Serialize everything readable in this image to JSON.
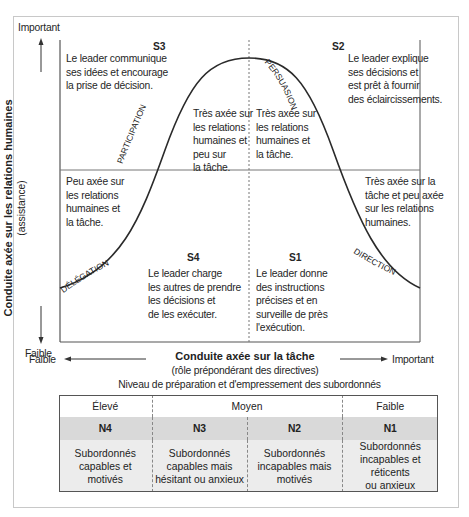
{
  "y_axis": {
    "top_label": "Important",
    "bottom_label": "Faible",
    "title": "Conduite axée sur les relations humaines",
    "subtitle": "(assistance)"
  },
  "x_axis": {
    "left_label": "Faible",
    "right_label": "Important",
    "title": "Conduite axée sur la tâche",
    "subtitle": "(rôle prépondérant des directives)"
  },
  "quadrants": {
    "s3": {
      "code": "S3",
      "text": [
        "Le leader communique",
        "ses idées et encourage",
        "la prise de décision."
      ]
    },
    "s2": {
      "code": "S2",
      "text": [
        "Le leader explique",
        "ses décisions et",
        "est prêt à fournir",
        "des éclaircissements."
      ]
    },
    "s4": {
      "code": "S4",
      "text": [
        "Le leader charge",
        "les autres de prendre",
        "les décisions et",
        "de les exécuter."
      ]
    },
    "s1": {
      "code": "S1",
      "text": [
        "Le leader donne",
        "des instructions",
        "précises et en",
        "surveille de près",
        "l'exécution."
      ]
    }
  },
  "inner_notes": {
    "top_left_of_center": [
      "Très axée sur",
      "les relations",
      "humaines et",
      "peu sur",
      "la tâche."
    ],
    "top_right_of_center": [
      "Très axée sur",
      "les relations",
      "humaines et",
      "la tâche."
    ],
    "bottom_left": [
      "Peu axée sur",
      "les relations",
      "humaines et",
      "la tâche."
    ],
    "bottom_right": [
      "Très axée sur la",
      "tâche et peu axée",
      "sur les relations",
      "humaines."
    ]
  },
  "curve_labels": {
    "participation": "PARTICIPATION",
    "persuasion": "PERSUASION",
    "delegation": "DÉLÉGATION",
    "direction": "DIRECTION"
  },
  "readiness": {
    "title": "Niveau de préparation et d'empressement des subordonnés",
    "levels": [
      "Élevé",
      "Moyen",
      "Faible"
    ],
    "codes": [
      "N4",
      "N3",
      "N2",
      "N1"
    ],
    "descriptions": [
      [
        "Subordonnés",
        "capables et",
        "motivés"
      ],
      [
        "Subordonnés",
        "capables mais",
        "hésitant ou anxieux"
      ],
      [
        "Subordonnés",
        "incapables mais",
        "motivés"
      ],
      [
        "Subordonnés",
        "incapables et réticents",
        "ou anxieux"
      ]
    ]
  },
  "colors": {
    "line": "#2a2a2a",
    "grid": "#7a7a7a",
    "code_row_bg": "#d9d9d9",
    "desc_row_bg": "#ececec"
  }
}
